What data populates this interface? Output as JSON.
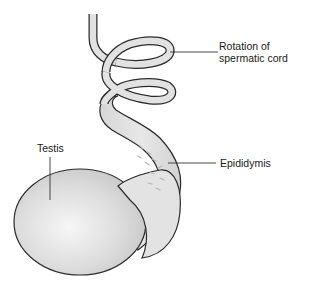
{
  "diagram": {
    "labels": {
      "cord": {
        "line1": "Rotation of",
        "line2": "spermatic cord"
      },
      "epididymis": "Epididymis",
      "testis": "Testis"
    },
    "colors": {
      "outline": "#2b2b2b",
      "cord_fill": "#e2e2e2",
      "testis_highlight": "#f4f4f4",
      "testis_shadow": "#c9c9c9",
      "epididymis_fill": "#dedede",
      "leader_line": "#333333"
    }
  }
}
